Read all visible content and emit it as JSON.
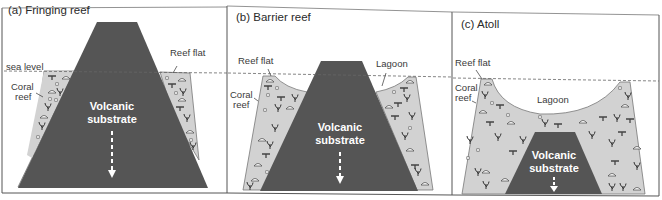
{
  "colors": {
    "background": "#ffffff",
    "volcano": "#555555",
    "reef_fill": "#d2d2d2",
    "reef_stroke": "#777777",
    "frame": "#555555",
    "sea_level": "#666666",
    "text": "#333333",
    "volcano_text": "#ffffff"
  },
  "panels": [
    {
      "id": "a",
      "title": "(a) Fringing reef",
      "labels": {
        "sea_level": "sea level",
        "coral_reef_1": "Coral",
        "coral_reef_2": "reef",
        "reef_flat": "Reef flat",
        "volcanic_1": "Volcanic",
        "volcanic_2": "substrate"
      }
    },
    {
      "id": "b",
      "title": "(b) Barrier reef",
      "labels": {
        "reef_flat": "Reef flat",
        "lagoon": "Lagoon",
        "coral_reef_1": "Coral",
        "coral_reef_2": "reef",
        "volcanic_1": "Volcanic",
        "volcanic_2": "substrate"
      }
    },
    {
      "id": "c",
      "title": "(c) Atoll",
      "labels": {
        "reef_flat": "Reef flat",
        "coral_reef_1": "Coral",
        "coral_reef_2": "reef",
        "lagoon": "Lagoon",
        "volcanic_1": "Volcanic",
        "volcanic_2": "substrate"
      }
    }
  ],
  "icons": {
    "subsidence_arrow": "dashed-down-arrow",
    "coral_symbols": [
      "branching-coral",
      "mushroom-coral",
      "table-coral",
      "pebble"
    ]
  }
}
